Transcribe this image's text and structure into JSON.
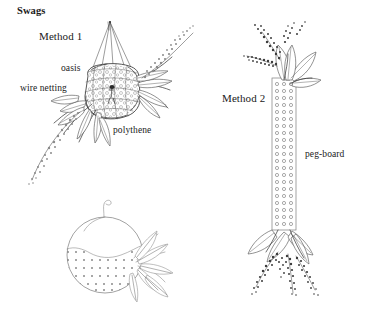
{
  "page": {
    "title": "Swags",
    "background_color": "#ffffff",
    "ink_color": "#2b2b2b",
    "width": 365,
    "height": 317
  },
  "labels": {
    "title": "Swags",
    "method_1": "Method 1",
    "oasis": "oasis",
    "wire_netting": "wire netting",
    "polythene": "polythene",
    "method_2": "Method 2",
    "peg_board": "peg-board"
  },
  "figures": [
    {
      "name": "method-1-swag",
      "caption": "Method 1",
      "parts": [
        "oasis",
        "wire netting",
        "polythene"
      ],
      "description": "Oasis block wrapped in wire netting and polythene, suspended by strings, with trailing foliage and flower spikes"
    },
    {
      "name": "hanging-ball-swag",
      "caption": "",
      "parts": [
        "hook",
        "mesh",
        "foliage"
      ],
      "description": "Round hanging swag ball with wire hook and dotted mesh lower half, foliage to the right"
    },
    {
      "name": "method-2-pegboard",
      "caption": "Method 2",
      "parts": [
        "peg-board"
      ],
      "description": "Vertical peg-board strip with three columns of holes, foliage and flower spikes at top and bottom"
    }
  ]
}
